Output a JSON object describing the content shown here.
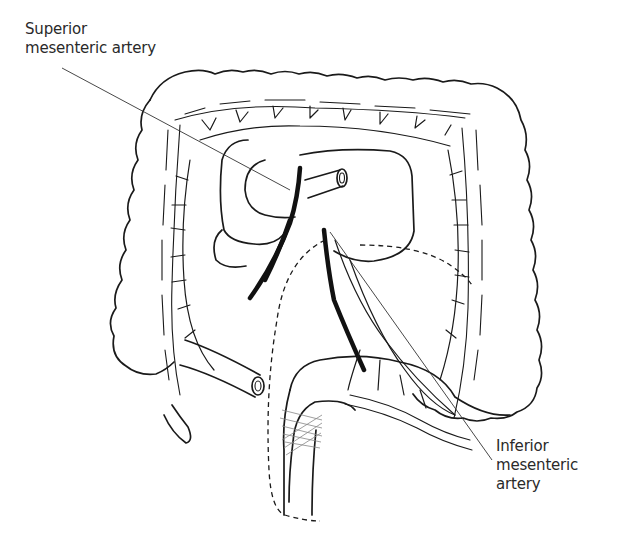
{
  "diagram": {
    "type": "anatomical-illustration",
    "labels": {
      "superior": {
        "lines": [
          "Superior",
          "mesenteric artery"
        ]
      },
      "inferior": {
        "lines": [
          "Inferior",
          "mesenteric",
          "artery"
        ]
      }
    },
    "colors": {
      "line": "#1a1a1a",
      "text": "#2a2a2a",
      "background": "#ffffff"
    }
  }
}
